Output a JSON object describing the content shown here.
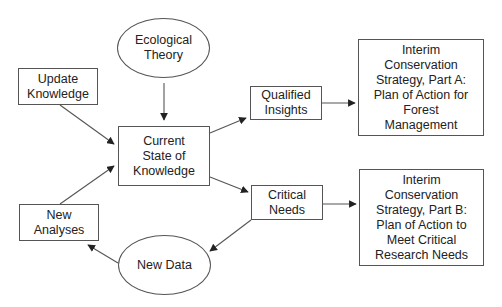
{
  "diagram": {
    "type": "flowchart",
    "colors": {
      "stroke": "#555555",
      "text": "#222222",
      "background": "#ffffff"
    },
    "nodes": {
      "ecological_theory": {
        "label": "Ecological\nTheory",
        "shape": "ellipse"
      },
      "update_knowledge": {
        "label": "Update\nKnowledge",
        "shape": "box"
      },
      "current_state": {
        "label": "Current\nState of\nKnowledge",
        "shape": "box"
      },
      "new_analyses": {
        "label": "New\nAnalyses",
        "shape": "box"
      },
      "new_data": {
        "label": "New Data",
        "shape": "ellipse"
      },
      "qualified_insights": {
        "label": "Qualified\nInsights",
        "shape": "box"
      },
      "critical_needs": {
        "label": "Critical\nNeeds",
        "shape": "box"
      },
      "strategy_a": {
        "label": "Interim\nConservation\nStrategy, Part A:\nPlan of Action for\nForest\nManagement",
        "shape": "box"
      },
      "strategy_b": {
        "label": "Interim\nConservation\nStrategy, Part B:\nPlan of Action to\nMeet Critical\nResearch Needs",
        "shape": "box"
      }
    },
    "edges": [
      {
        "from": "ecological_theory",
        "to": "current_state"
      },
      {
        "from": "update_knowledge",
        "to": "current_state"
      },
      {
        "from": "new_analyses",
        "to": "current_state"
      },
      {
        "from": "current_state",
        "to": "qualified_insights"
      },
      {
        "from": "current_state",
        "to": "critical_needs"
      },
      {
        "from": "qualified_insights",
        "to": "strategy_a"
      },
      {
        "from": "critical_needs",
        "to": "strategy_b"
      },
      {
        "from": "critical_needs",
        "to": "new_data"
      },
      {
        "from": "new_data",
        "to": "new_analyses"
      }
    ]
  }
}
